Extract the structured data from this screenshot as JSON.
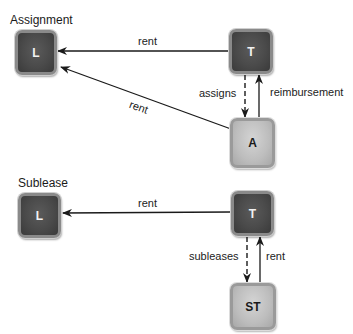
{
  "assignment": {
    "title": "Assignment",
    "nodes": {
      "landlord": "L",
      "tenant": "T",
      "assignee": "A"
    },
    "edges": {
      "tenant_to_landlord": "rent",
      "assignee_to_landlord": "rent",
      "tenant_to_assignee": "assigns",
      "assignee_to_tenant": "reimbursement"
    }
  },
  "sublease": {
    "title": "Sublease",
    "nodes": {
      "landlord": "L",
      "tenant": "T",
      "subtenant": "ST"
    },
    "edges": {
      "tenant_to_landlord": "rent",
      "tenant_to_subtenant": "subleases",
      "subtenant_to_tenant": "rent"
    }
  },
  "colors": {
    "dark_node": "#4a4a4a",
    "light_node": "#bdbdbd",
    "line": "#1a1a1a"
  }
}
